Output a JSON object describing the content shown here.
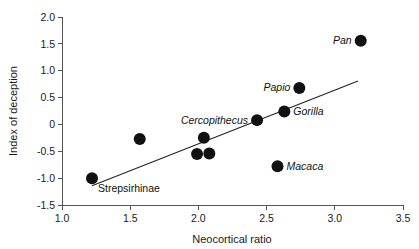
{
  "chart_data": {
    "type": "scatter",
    "title": "",
    "xlabel": "Neocortical ratio",
    "ylabel": "Index of deception",
    "xlim": [
      1.0,
      3.5
    ],
    "ylim": [
      -1.5,
      2.0
    ],
    "xticks": [
      "1.0",
      "1.5",
      "2.0",
      "2.5",
      "3.0",
      "3.5"
    ],
    "xtick_values": [
      1.0,
      1.5,
      2.0,
      2.5,
      3.0,
      3.5
    ],
    "yticks": [
      "2.0",
      "1.5",
      "1.0",
      "0.5",
      "0",
      "-0.5",
      "-1.0",
      "-1.5"
    ],
    "ytick_values": [
      2.0,
      1.5,
      1.0,
      0.5,
      0,
      -0.5,
      -1.0,
      -1.5
    ],
    "grid": false,
    "legend": "none",
    "marker_color": "#111111",
    "marker_size": 6,
    "points": [
      {
        "x": 1.22,
        "y": -1.0,
        "label": "Strepsirhinae",
        "label_pos": "below-right",
        "label_style": "plain"
      },
      {
        "x": 1.57,
        "y": -0.27,
        "label": "",
        "label_pos": "",
        "label_style": "italic"
      },
      {
        "x": 2.04,
        "y": -0.25,
        "label": "",
        "label_pos": "",
        "label_style": "italic"
      },
      {
        "x": 1.99,
        "y": -0.55,
        "label": "",
        "label_pos": "",
        "label_style": "italic"
      },
      {
        "x": 2.08,
        "y": -0.54,
        "label": "",
        "label_pos": "",
        "label_style": "italic"
      },
      {
        "x": 2.43,
        "y": 0.08,
        "label": "Cercopithecus",
        "label_pos": "left",
        "label_style": "italic"
      },
      {
        "x": 2.63,
        "y": 0.24,
        "label": "Gorilla",
        "label_pos": "right",
        "label_style": "italic"
      },
      {
        "x": 2.74,
        "y": 0.68,
        "label": "Papio",
        "label_pos": "left",
        "label_style": "italic"
      },
      {
        "x": 2.58,
        "y": -0.78,
        "label": "Macaca",
        "label_pos": "right",
        "label_style": "italic"
      },
      {
        "x": 3.19,
        "y": 1.56,
        "label": "Pan",
        "label_pos": "left",
        "label_style": "italic"
      }
    ],
    "trend_line": {
      "x1": 1.22,
      "y1": -1.14,
      "x2": 3.17,
      "y2": 0.81
    }
  }
}
